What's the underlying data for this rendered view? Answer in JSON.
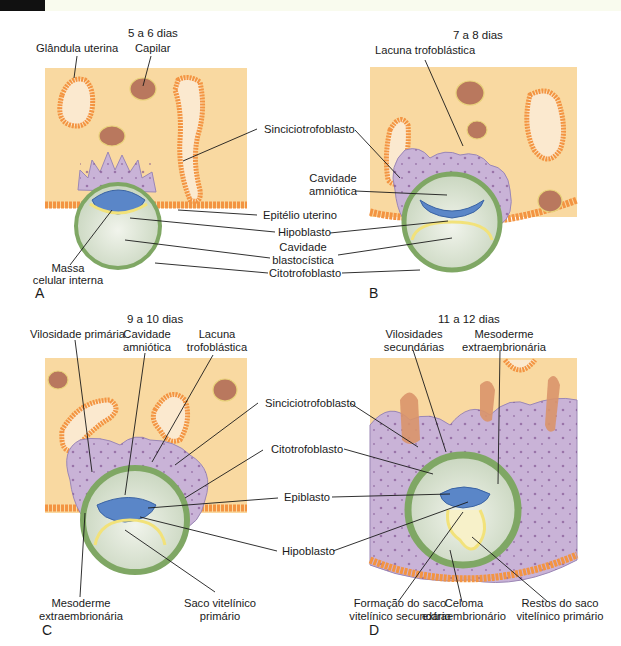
{
  "figure": {
    "colors": {
      "endometrium": "#f9d9a1",
      "gland": "#f39442",
      "capillary": "#b9785e",
      "syncytiotrophoblast": "#c9b3d7",
      "cytotrophoblast": "#7fa764",
      "epiblast": "#5a86c8",
      "hypoblast": "#f2e27a",
      "cavity": "#dfe7d6",
      "epithelium": "#f7a64a"
    },
    "panels": [
      {
        "letter": "A",
        "stage": "5 a 6 dias",
        "labels": {
          "glandula": "Glândula uterina",
          "capilar": "Capilar",
          "massa_1": "Massa",
          "massa_2": "celular interna"
        }
      },
      {
        "letter": "B",
        "stage": "7 a 8 dias",
        "labels": {
          "lacuna": "Lacuna trofoblástica"
        }
      },
      {
        "letter": "C",
        "stage": "9 a 10 dias",
        "labels": {
          "vilosidade": "Vilosidade primária",
          "cavidade_1": "Cavidade",
          "cavidade_2": "amniótica",
          "lacuna_1": "Lacuna",
          "lacuna_2": "trofoblástica",
          "mesoderme_1": "Mesoderme",
          "mesoderme_2": "extraembrionária",
          "saco_1": "Saco vitelínico",
          "saco_2": "primário"
        }
      },
      {
        "letter": "D",
        "stage": "11 a 12 dias",
        "labels": {
          "vilosidades_1": "Vilosidades",
          "vilosidades_2": "secundárias",
          "mesoderme_1": "Mesoderme",
          "mesoderme_2": "extraembrionária",
          "formacao_1": "Formação do saco",
          "formacao_2": "vitelínico secundário",
          "celoma_1": "Celoma",
          "celoma_2": "extraembrionário",
          "restos_1": "Restos do saco",
          "restos_2": "vitelínico primário"
        }
      }
    ],
    "center_labels_top": {
      "sinciciotrofoblasto": "Sinciciotrofoblasto",
      "cavidade_amniotica_1": "Cavidade",
      "cavidade_amniotica_2": "amniótica",
      "epitelio": "Epitélio uterino",
      "hipoblasto": "Hipoblasto",
      "cavidade_blasto_1": "Cavidade",
      "cavidade_blasto_2": "blastocística",
      "citotrofoblasto": "Citotrofoblasto"
    },
    "center_labels_bottom": {
      "sinciciotrofoblasto": "Sinciciotrofoblasto",
      "citotrofoblasto": "Citotrofoblasto",
      "epiblasto": "Epiblasto",
      "hipoblasto": "Hipoblasto"
    }
  }
}
